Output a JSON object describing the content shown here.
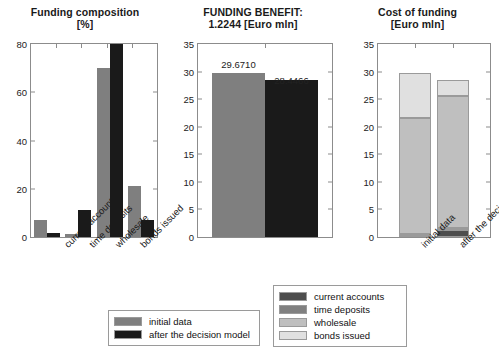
{
  "figure": {
    "background": "#ffffff",
    "colors": {
      "current_accounts": "#4d4d4d",
      "time_deposits": "#808080",
      "wholesale": "#bfbfbf",
      "bonds_issued": "#e0e0e0",
      "initial_data": "#7f7f7f",
      "after_model": "#1a1a1a",
      "axis": "#8c8c8c"
    }
  },
  "chart_data": [
    {
      "id": "funding-composition",
      "type": "bar",
      "title": "Funding composition",
      "subtitle": "[%]",
      "xlabel": "",
      "ylabel": "",
      "ylim": [
        0,
        80
      ],
      "yticks": [
        0,
        20,
        40,
        60,
        80
      ],
      "grid": false,
      "categories": [
        "current accounts",
        "time deposits",
        "wholesale",
        "bonds issued"
      ],
      "series": [
        {
          "name": "initial data",
          "color": "#7f7f7f",
          "values": [
            7.0,
            1.4,
            70.0,
            21.0
          ]
        },
        {
          "name": "after the decision model",
          "color": "#1a1a1a",
          "values": [
            1.8,
            11.0,
            80.5,
            7.0
          ]
        }
      ],
      "legend_position": "below",
      "notes": "second-series wholesale bar is clipped at the 80 axis maximum"
    },
    {
      "id": "funding-benefit",
      "type": "bar",
      "title": "FUNDING BENEFIT:",
      "subtitle": "1.2244 [Euro mln]",
      "benefit_value": "1.2244",
      "benefit_unit": "[Euro mln]",
      "xlabel": "",
      "ylabel": "",
      "ylim": [
        0,
        35
      ],
      "yticks": [
        0,
        5,
        10,
        15,
        20,
        25,
        30,
        35
      ],
      "grid": false,
      "categories": [
        "initial data",
        "after the decision model"
      ],
      "values": [
        29.671,
        28.4466
      ],
      "data_labels": [
        "29.6710",
        "28.4466"
      ],
      "colors": [
        "#7f7f7f",
        "#1a1a1a"
      ],
      "legend_position": "none"
    },
    {
      "id": "cost-of-funding",
      "type": "bar",
      "stacked": true,
      "title": "Cost of funding",
      "subtitle": "[Euro mln]",
      "xlabel": "",
      "ylabel": "",
      "ylim": [
        0,
        35
      ],
      "yticks": [
        0,
        5,
        10,
        15,
        20,
        25,
        30,
        35
      ],
      "grid": false,
      "categories": [
        "initial data",
        "after the decision model"
      ],
      "series": [
        {
          "name": "current accounts",
          "color": "#4d4d4d",
          "values": [
            0.35,
            1.25
          ]
        },
        {
          "name": "time deposits",
          "color": "#808080",
          "values": [
            0.15,
            0.3
          ]
        },
        {
          "name": "wholesale",
          "color": "#bfbfbf",
          "values": [
            21.1,
            23.95
          ]
        },
        {
          "name": "bonds issued",
          "color": "#e0e0e0",
          "values": [
            8.07,
            2.95
          ]
        }
      ],
      "totals": [
        29.67,
        28.45
      ],
      "legend_position": "left-outside"
    }
  ],
  "legends": {
    "series_legend": {
      "items": [
        {
          "label": "initial data",
          "color": "#7f7f7f"
        },
        {
          "label": "after the decision model",
          "color": "#1a1a1a"
        }
      ]
    },
    "component_legend": {
      "items": [
        {
          "label": "current accounts",
          "color": "#4d4d4d"
        },
        {
          "label": "time deposits",
          "color": "#808080"
        },
        {
          "label": "wholesale",
          "color": "#bfbfbf"
        },
        {
          "label": "bonds issued",
          "color": "#e0e0e0"
        }
      ]
    }
  }
}
